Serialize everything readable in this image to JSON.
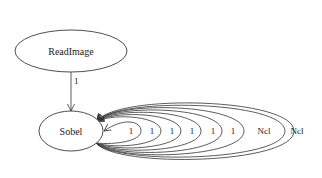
{
  "diagram": {
    "type": "directed-graph",
    "nodes": [
      {
        "id": "readimage",
        "label": "ReadImage"
      },
      {
        "id": "sobel",
        "label": "Sobel"
      }
    ],
    "edges": [
      {
        "from": "readimage",
        "to": "sobel",
        "label": "1"
      }
    ],
    "self_loops": [
      {
        "node": "sobel",
        "label": "1"
      },
      {
        "node": "sobel",
        "label": "1"
      },
      {
        "node": "sobel",
        "label": "1"
      },
      {
        "node": "sobel",
        "label": "1"
      },
      {
        "node": "sobel",
        "label": "1"
      },
      {
        "node": "sobel",
        "label": "1"
      },
      {
        "node": "sobel",
        "label": "Ncl"
      },
      {
        "node": "sobel",
        "label": "Ncl"
      }
    ]
  }
}
